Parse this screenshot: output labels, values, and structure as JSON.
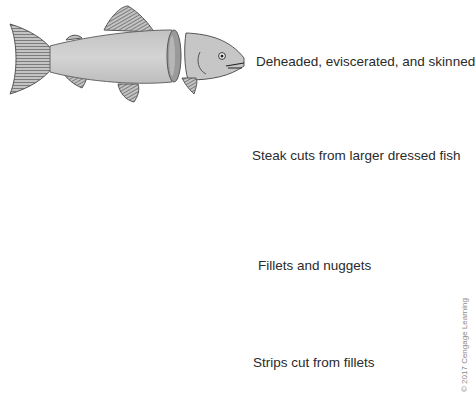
{
  "diagram": {
    "rows": [
      {
        "id": "dressed",
        "label": "Deheaded, eviscerated, and skinned"
      },
      {
        "id": "steaks",
        "label": "Steak cuts from larger dressed fish"
      },
      {
        "id": "fillets",
        "label": "Fillets and nuggets"
      },
      {
        "id": "strips",
        "label": "Strips cut from fillets"
      }
    ],
    "credit": "© 2017 Cengage Learning",
    "colors": {
      "flesh": "#c9c9c9",
      "flesh_light": "#d8d8d8",
      "shadow": "#8c8c8c",
      "outline": "#555555",
      "fin": "#b5b5b5",
      "text": "#2a2a2a"
    }
  }
}
